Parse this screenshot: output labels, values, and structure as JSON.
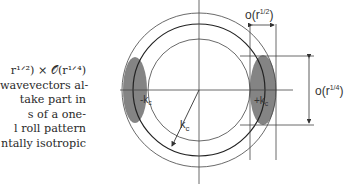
{
  "text_lines": [
    "r¹ᐟ²) × 𝒪(r¹ᐟ⁴)",
    "wavevectors al-",
    "take   part   in",
    "s   of   a   one-",
    "l  roll  pattern",
    "ntally isotropic"
  ],
  "figure": {
    "label_top": "o(r",
    "label_top_exp": "1/2",
    "label_right": "o(r",
    "label_right_exp": "1/4",
    "close_paren": ")",
    "radius_label": "k",
    "radius_sub": "c",
    "left_label": "-k",
    "left_sub": "c",
    "right_label": "+k",
    "right_sub": "c"
  },
  "colors": {
    "ink": "#333333",
    "shade": "#6e6e6e"
  }
}
